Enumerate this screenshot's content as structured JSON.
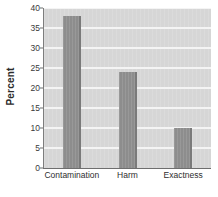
{
  "chart_data": {
    "type": "bar",
    "title": "",
    "xlabel": "",
    "ylabel": "Percent",
    "categories": [
      "Contamination",
      "Harm",
      "Exactness"
    ],
    "values": [
      38,
      24,
      10
    ],
    "ylim": [
      0,
      40
    ],
    "yticks": [
      0,
      5,
      10,
      15,
      20,
      25,
      30,
      35,
      40
    ],
    "ytick_labels": [
      "0",
      "5",
      "10",
      "15",
      "20",
      "25",
      "30",
      "35",
      "40"
    ],
    "grid": true,
    "grid_orientation": "horizontal",
    "legend": false,
    "legend_position": "none",
    "colors": {
      "bar": "#8d8d8d",
      "bar_edge": "#7a7a7a",
      "plot_background": "#d6d6d6",
      "gridline": "#f4f4f4",
      "axis": "#6e6e6e",
      "text": "#2e2e2e"
    }
  }
}
